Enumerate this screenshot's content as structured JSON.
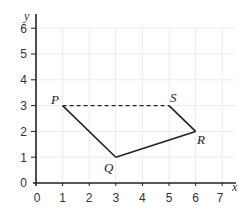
{
  "diagram": {
    "type": "coordinate-grid-quadrilateral",
    "axes": {
      "x_label": "x",
      "y_label": "y",
      "x_ticks": [
        "0",
        "1",
        "2",
        "3",
        "4",
        "5",
        "6",
        "7"
      ],
      "y_ticks": [
        "0",
        "1",
        "2",
        "3",
        "4",
        "5",
        "6"
      ],
      "x_range": [
        0,
        7
      ],
      "y_range": [
        0,
        6
      ]
    },
    "points": [
      {
        "label": "P",
        "x": 1,
        "y": 3
      },
      {
        "label": "Q",
        "x": 3,
        "y": 1
      },
      {
        "label": "R",
        "x": 6,
        "y": 2
      },
      {
        "label": "S",
        "x": 5,
        "y": 3
      }
    ],
    "segments": [
      {
        "from": "P",
        "to": "Q",
        "style": "solid"
      },
      {
        "from": "Q",
        "to": "R",
        "style": "solid"
      },
      {
        "from": "R",
        "to": "S",
        "style": "solid"
      },
      {
        "from": "P",
        "to": "S",
        "style": "dashed"
      }
    ],
    "colors": {
      "grid": "#ececec",
      "axis": "#222222",
      "line": "#222222"
    }
  }
}
